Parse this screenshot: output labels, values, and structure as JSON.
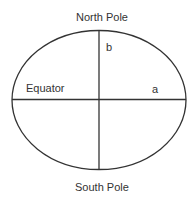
{
  "diagram": {
    "labels": {
      "north": "North Pole",
      "south": "South Pole",
      "equator": "Equator",
      "semi_major": "a",
      "semi_minor": "b"
    },
    "colors": {
      "stroke": "#333333",
      "text": "#333333",
      "background": "#ffffff"
    }
  }
}
